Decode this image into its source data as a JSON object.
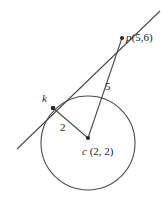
{
  "figure": {
    "background_color": "#ffffff",
    "stroke_color": "#4a4a4a",
    "text_color": "#222222",
    "width": 168,
    "height": 202
  },
  "labels": {
    "point_p": {
      "name": "p",
      "coords": "(5,6)",
      "full": "p(5,6)"
    },
    "point_k": {
      "name": "k",
      "full": "k"
    },
    "point_c": {
      "name": "c",
      "coords": "(2, 2)",
      "full": "c (2, 2)"
    },
    "segment_pc_length": "5",
    "segment_kc_length": "2"
  },
  "geometry": {
    "circle": {
      "cx": 88,
      "cy": 143,
      "r": 47
    },
    "points": {
      "p": {
        "x": 122,
        "y": 38
      },
      "k": {
        "x": 53,
        "y": 108
      },
      "c": {
        "x": 88,
        "y": 138
      }
    },
    "tangent_line": {
      "x1": 17,
      "y1": 149,
      "x2": 160,
      "y2": 11
    },
    "segment_pc": {
      "x1": 122,
      "y1": 38,
      "x2": 88,
      "y2": 138
    },
    "segment_kc": {
      "x1": 53,
      "y1": 108,
      "x2": 88,
      "y2": 138
    }
  }
}
